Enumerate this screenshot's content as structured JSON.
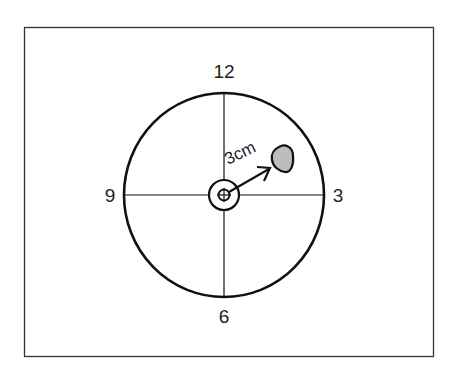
{
  "diagram": {
    "type": "clock-face position diagram",
    "labels": {
      "top": "12",
      "right": "3",
      "bottom": "6",
      "left": "9"
    },
    "distance_label": "3cm",
    "colors": {
      "stroke": "#111111",
      "lesion_fill": "#bdbdbd",
      "background": "#ffffff"
    }
  }
}
